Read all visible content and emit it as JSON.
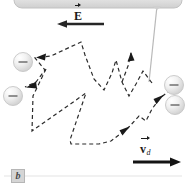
{
  "figure": {
    "caption_tag": "b",
    "background_color": "#ffffff",
    "labels": {
      "electric_field": {
        "symbol": "E",
        "subscript": "",
        "name": "electric-field-vector-label"
      },
      "drift_velocity": {
        "symbol": "v",
        "subscript": "d",
        "name": "drift-velocity-vector-label"
      }
    },
    "colors": {
      "ink": "#1a1a1a",
      "path": "#2b2b2b",
      "sphere_fill": "#e9e9e9",
      "sphere_edge": "#bdbdbd",
      "bar_fill": "#dcdcdc",
      "bar_edge": "#c2c2c2",
      "rule": "#e3e3e3",
      "tag_fill": "#d5d5d5"
    },
    "electrode_bar": {
      "name": "top-electrode-bar",
      "x": 14,
      "y": -10,
      "width": 168,
      "height": 18,
      "radius": 8
    },
    "lead_wire": {
      "name": "lead-wire",
      "x1": 157,
      "y1": 6,
      "x2": 149,
      "y2": 82
    },
    "baseline_rule": {
      "name": "baseline-rule",
      "x1": 4,
      "y1": 176,
      "x2": 182,
      "y2": 176
    },
    "field_arrow": {
      "name": "electric-field-arrow",
      "x1": 102,
      "y1": 24,
      "x2": 58,
      "y2": 24,
      "direction": "left",
      "thickness": 2.6
    },
    "drift_arrow": {
      "name": "drift-velocity-arrow",
      "x1": 133,
      "y1": 162,
      "x2": 181,
      "y2": 162,
      "direction": "right",
      "thickness": 2.6
    },
    "spheres": [
      {
        "name": "ion-sphere-left-upper",
        "cx": 23,
        "cy": 62,
        "r": 9.5,
        "charge": "minus"
      },
      {
        "name": "ion-sphere-left-lower",
        "cx": 13,
        "cy": 96,
        "r": 9.5,
        "charge": "minus"
      },
      {
        "name": "ion-sphere-right-upper",
        "cx": 174,
        "cy": 85,
        "r": 9.5,
        "charge": "minus"
      },
      {
        "name": "ion-sphere-right-lower",
        "cx": 175,
        "cy": 105,
        "r": 9.5,
        "charge": "minus"
      }
    ],
    "electron_path": {
      "name": "electron-random-walk-path",
      "dash": "4 3",
      "stroke_width": 1.2,
      "points": [
        [
          152,
          83
        ],
        [
          143,
          71
        ],
        [
          136,
          84
        ],
        [
          129,
          96
        ],
        [
          122,
          82
        ],
        [
          116,
          60
        ],
        [
          112,
          73
        ],
        [
          104,
          90
        ],
        [
          94,
          79
        ],
        [
          85,
          55
        ],
        [
          81,
          42
        ],
        [
          51,
          56
        ],
        [
          35,
          58
        ],
        [
          45,
          70
        ],
        [
          36,
          82
        ],
        [
          25,
          87
        ],
        [
          46,
          69
        ],
        [
          33,
          96
        ],
        [
          32,
          131
        ],
        [
          86,
          93
        ],
        [
          70,
          140
        ],
        [
          71,
          144
        ],
        [
          99,
          144
        ],
        [
          111,
          141
        ],
        [
          128,
          128
        ],
        [
          139,
          116
        ],
        [
          146,
          121
        ],
        [
          152,
          109
        ],
        [
          160,
          98
        ],
        [
          168,
          92
        ]
      ]
    },
    "path_arrowheads": [
      {
        "name": "path-arrowhead-upper-left",
        "x": 37,
        "y": 57,
        "angle": 188
      },
      {
        "name": "path-arrowhead-mid-left",
        "x": 27,
        "y": 86,
        "angle": 205
      },
      {
        "name": "path-arrowhead-lower-right",
        "x": 127,
        "y": 129,
        "angle": -40
      },
      {
        "name": "path-arrowhead-upper-right",
        "x": 161,
        "y": 97,
        "angle": -40
      }
    ]
  }
}
